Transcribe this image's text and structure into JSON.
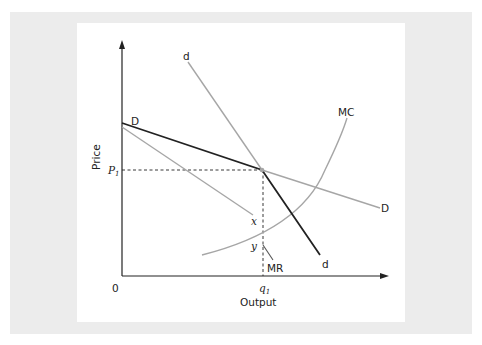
{
  "figure": {
    "type": "kinked-demand-curve",
    "axes": {
      "y_label": "Price",
      "x_label": "Output",
      "origin_label": "0"
    },
    "markers": {
      "price_level": "P",
      "price_subscript": "1",
      "quantity_level": "q",
      "quantity_subscript": "1",
      "gap_top": "x",
      "gap_bottom": "y"
    },
    "curves": {
      "demand_elastic_label": "D",
      "demand_elastic_end_label": "D",
      "demand_inelastic_top_label": "d",
      "demand_inelastic_end_label": "d",
      "marginal_revenue_label": "MR",
      "marginal_cost_label": "MC"
    },
    "colors": {
      "kinked_curve": "#222222",
      "light_curves": "#a6a6a6",
      "axes": "#222222",
      "outer_background": "#ececec",
      "panel_background": "#ffffff"
    }
  }
}
